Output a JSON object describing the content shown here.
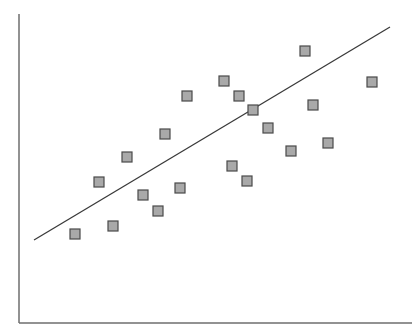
{
  "chart_data": {
    "type": "scatter",
    "title": "",
    "xlabel": "",
    "ylabel": "",
    "grid": false,
    "legend": null,
    "ticks": {
      "x": [],
      "y": []
    },
    "note": "Values are in pixel coordinates of the plot area (origin at axis intersection, y increasing upward); no axis tick labels are shown.",
    "xlim": [
      0,
      393
    ],
    "ylim": [
      0,
      309
    ],
    "series": [
      {
        "name": "points",
        "marker": "square",
        "points": [
          {
            "x": 56,
            "y": 89
          },
          {
            "x": 94,
            "y": 97
          },
          {
            "x": 80,
            "y": 141
          },
          {
            "x": 108,
            "y": 166
          },
          {
            "x": 124,
            "y": 128
          },
          {
            "x": 139,
            "y": 112
          },
          {
            "x": 146,
            "y": 189
          },
          {
            "x": 161,
            "y": 135
          },
          {
            "x": 168,
            "y": 227
          },
          {
            "x": 205,
            "y": 242
          },
          {
            "x": 213,
            "y": 157
          },
          {
            "x": 220,
            "y": 227
          },
          {
            "x": 228,
            "y": 142
          },
          {
            "x": 234,
            "y": 213
          },
          {
            "x": 249,
            "y": 195
          },
          {
            "x": 272,
            "y": 172
          },
          {
            "x": 286,
            "y": 272
          },
          {
            "x": 294,
            "y": 218
          },
          {
            "x": 309,
            "y": 180
          },
          {
            "x": 353,
            "y": 241
          }
        ]
      }
    ],
    "trendline": {
      "type": "linear",
      "start": {
        "x": 15,
        "y": 83
      },
      "end": {
        "x": 371,
        "y": 296
      }
    }
  },
  "style": {
    "axis_color": "#6e6e6e",
    "trend_color": "#3a3a3a",
    "marker_fill": "#a9a9a9",
    "marker_stroke": "#4a4a4a",
    "marker_size": 10
  },
  "layout": {
    "origin_px": {
      "x": 19,
      "y": 323
    },
    "y_axis_top_px": 14,
    "x_axis_right_px": 412
  }
}
